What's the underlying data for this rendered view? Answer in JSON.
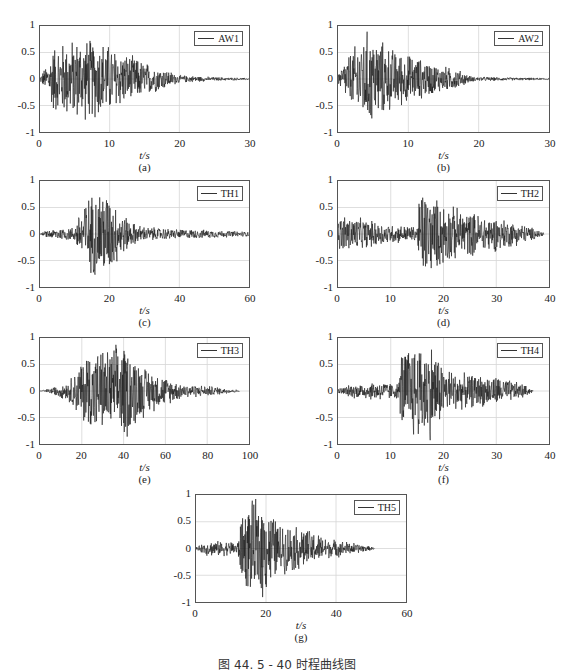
{
  "figure": {
    "caption": "图 44. 5 - 40   时程曲线图"
  },
  "chart_data": [
    {
      "type": "line",
      "panel": "(a)",
      "legend": "AW1",
      "xlabel": "t/s",
      "ylabel": "",
      "xlim": [
        0,
        30
      ],
      "ylim": [
        -1,
        1
      ],
      "xticks": [
        "0",
        "10",
        "20",
        "30"
      ],
      "yticks": [
        "1",
        "0.5",
        "0",
        "-0.5",
        "-1"
      ],
      "grid": true,
      "legend_position": "upper right",
      "envelope": {
        "t": [
          0,
          1,
          2,
          4,
          6,
          9,
          12,
          15,
          18,
          20,
          25,
          30
        ],
        "amp": [
          0.05,
          0.3,
          0.7,
          0.8,
          0.85,
          0.8,
          0.55,
          0.35,
          0.2,
          0.08,
          0.04,
          0.02
        ]
      },
      "peaks": {
        "max": 0.82,
        "min": -0.88
      }
    },
    {
      "type": "line",
      "panel": "(b)",
      "legend": "AW2",
      "xlabel": "t/s",
      "ylabel": "",
      "xlim": [
        0,
        30
      ],
      "ylim": [
        -1,
        1
      ],
      "xticks": [
        "0",
        "10",
        "20",
        "30"
      ],
      "yticks": [
        "1",
        "0.5",
        "0",
        "-0.5",
        "-1"
      ],
      "grid": true,
      "legend_position": "upper right",
      "envelope": {
        "t": [
          0,
          1,
          2,
          4,
          5,
          8,
          11,
          14,
          17,
          19,
          25,
          30
        ],
        "amp": [
          0.1,
          0.4,
          0.6,
          1.0,
          0.9,
          0.6,
          0.45,
          0.3,
          0.2,
          0.05,
          0.03,
          0.02
        ]
      },
      "peaks": {
        "max": 1.0,
        "min": -0.82
      }
    },
    {
      "type": "line",
      "panel": "(c)",
      "legend": "TH1",
      "xlabel": "t/s",
      "ylabel": "",
      "xlim": [
        0,
        60
      ],
      "ylim": [
        -1,
        1
      ],
      "xticks": [
        "0",
        "20",
        "40",
        "60"
      ],
      "yticks": [
        "1",
        "0.5",
        "0",
        "-0.5",
        "-1"
      ],
      "grid": true,
      "legend_position": "upper right",
      "envelope": {
        "t": [
          0,
          2,
          5,
          10,
          12,
          18,
          22,
          26,
          30,
          40,
          50,
          60
        ],
        "amp": [
          0.0,
          0.08,
          0.12,
          0.15,
          0.65,
          1.0,
          0.6,
          0.25,
          0.15,
          0.1,
          0.08,
          0.05
        ]
      },
      "peaks": {
        "max": 0.7,
        "min": -1.0
      }
    },
    {
      "type": "line",
      "panel": "(d)",
      "legend": "TH2",
      "xlabel": "t/s",
      "ylabel": "",
      "xlim": [
        0,
        40
      ],
      "ylim": [
        -1,
        1
      ],
      "xticks": [
        "0",
        "10",
        "20",
        "30",
        "40"
      ],
      "yticks": [
        "1",
        "0.5",
        "0",
        "-0.5",
        "-1"
      ],
      "grid": true,
      "legend_position": "upper right",
      "envelope": {
        "t": [
          0,
          1,
          5,
          10,
          15,
          15.5,
          18,
          22,
          25,
          30,
          35,
          39
        ],
        "amp": [
          0.3,
          0.4,
          0.3,
          0.2,
          0.15,
          1.0,
          0.75,
          0.55,
          0.45,
          0.35,
          0.2,
          0.05
        ]
      },
      "peaks": {
        "max": 0.78,
        "min": -1.0
      }
    },
    {
      "type": "line",
      "panel": "(e)",
      "legend": "TH3",
      "xlabel": "t/s",
      "ylabel": "",
      "xlim": [
        0,
        110
      ],
      "ylim": [
        -1,
        1
      ],
      "xticks": [
        "0",
        "20",
        "40",
        "60",
        "80",
        "100"
      ],
      "yticks": [
        "1",
        "0.5",
        "0",
        "-0.5",
        "-1"
      ],
      "grid": true,
      "legend_position": "upper right",
      "envelope": {
        "t": [
          0,
          5,
          15,
          20,
          25,
          35,
          45,
          55,
          65,
          75,
          90,
          105
        ],
        "amp": [
          0.0,
          0.05,
          0.2,
          0.5,
          0.85,
          0.85,
          1.0,
          0.5,
          0.3,
          0.15,
          0.1,
          0.02
        ]
      },
      "peaks": {
        "max": 0.85,
        "min": -1.0
      }
    },
    {
      "type": "line",
      "panel": "(f)",
      "legend": "TH4",
      "xlabel": "t/s",
      "ylabel": "",
      "xlim": [
        0,
        40
      ],
      "ylim": [
        -1,
        1
      ],
      "xticks": [
        "0",
        "10",
        "20",
        "30",
        "40"
      ],
      "yticks": [
        "1",
        "0.5",
        "0",
        "-0.5",
        "-1"
      ],
      "grid": true,
      "legend_position": "upper right",
      "envelope": {
        "t": [
          0,
          3,
          8,
          11.5,
          12,
          14,
          18,
          20,
          24,
          30,
          35,
          37
        ],
        "amp": [
          0.05,
          0.15,
          0.2,
          0.15,
          0.85,
          1.0,
          1.0,
          0.5,
          0.35,
          0.3,
          0.15,
          0.02
        ]
      },
      "peaks": {
        "max": 1.0,
        "min": -1.0
      }
    },
    {
      "type": "line",
      "panel": "(g)",
      "legend": "TH5",
      "xlabel": "t/s",
      "ylabel": "",
      "xlim": [
        0,
        60
      ],
      "ylim": [
        -1,
        1
      ],
      "xticks": [
        "0",
        "20",
        "40",
        "60"
      ],
      "yticks": [
        "1",
        "0.5",
        "0",
        "-0.5",
        "-1"
      ],
      "grid": true,
      "legend_position": "upper right",
      "envelope": {
        "t": [
          0,
          3,
          8,
          12,
          13,
          16,
          19,
          24,
          30,
          38,
          45,
          51
        ],
        "amp": [
          0.02,
          0.15,
          0.15,
          0.15,
          0.7,
          0.95,
          1.0,
          0.5,
          0.45,
          0.2,
          0.12,
          0.02
        ]
      },
      "peaks": {
        "max": 0.92,
        "min": -1.0
      }
    }
  ],
  "layout": [
    {
      "left": 39,
      "top": 25,
      "width": 211,
      "height": 108
    },
    {
      "left": 337,
      "top": 25,
      "width": 213,
      "height": 108
    },
    {
      "left": 39,
      "top": 180,
      "width": 211,
      "height": 108
    },
    {
      "left": 337,
      "top": 180,
      "width": 213,
      "height": 108
    },
    {
      "left": 39,
      "top": 337,
      "width": 211,
      "height": 108
    },
    {
      "left": 337,
      "top": 337,
      "width": 213,
      "height": 108
    },
    {
      "left": 195,
      "top": 494,
      "width": 212,
      "height": 109
    }
  ],
  "colors": {
    "trace": "#1a1a1a",
    "grid": "#d6d6d6",
    "frame": "#555555"
  }
}
